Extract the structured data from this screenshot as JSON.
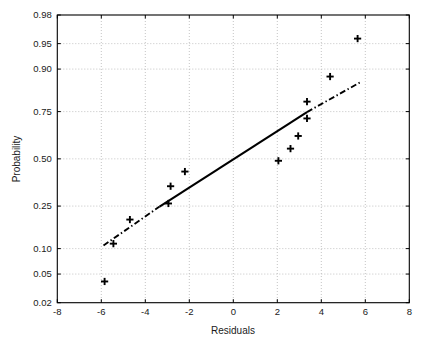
{
  "chart_data": {
    "type": "scatter",
    "title": "",
    "subtitle": "",
    "xlabel": "Residuals",
    "ylabel": "Probability",
    "xlim": [
      -8,
      8
    ],
    "ylim": [
      0.02,
      0.98
    ],
    "grid": true,
    "legend": null,
    "x_ticks": [
      -8,
      -6,
      -4,
      -2,
      0,
      2,
      4,
      6,
      8
    ],
    "x_tick_labels": [
      "-8",
      "-6",
      "-4",
      "-2",
      "0",
      "2",
      "4",
      "6",
      "8"
    ],
    "y_ticks": [
      0.02,
      0.05,
      0.1,
      0.25,
      0.5,
      0.75,
      0.9,
      0.95,
      0.98
    ],
    "y_tick_labels": [
      "0.02",
      "0.05",
      "0.10",
      "0.25",
      "0.50",
      "0.75",
      "0.90",
      "0.95",
      "0.98"
    ],
    "y_scale": "normal-probability",
    "series": [
      {
        "name": "data",
        "marker": "plus",
        "color": "#000000",
        "points": [
          {
            "x": -5.85,
            "p": 0.04
          },
          {
            "x": -5.45,
            "p": 0.113
          },
          {
            "x": -4.7,
            "p": 0.193
          },
          {
            "x": -2.95,
            "p": 0.262
          },
          {
            "x": -2.85,
            "p": 0.348
          },
          {
            "x": -2.2,
            "p": 0.428
          },
          {
            "x": 2.05,
            "p": 0.489
          },
          {
            "x": 2.6,
            "p": 0.558
          },
          {
            "x": 2.95,
            "p": 0.628
          },
          {
            "x": 3.35,
            "p": 0.718
          },
          {
            "x": 3.35,
            "p": 0.793
          },
          {
            "x": 4.4,
            "p": 0.88
          },
          {
            "x": 5.65,
            "p": 0.957
          }
        ]
      }
    ],
    "reference_line": {
      "name": "robust-fit-line",
      "style": "solid",
      "color": "#000000",
      "x_start": -3.35,
      "p_start": 0.248,
      "x_end": 3.35,
      "p_end": 0.748
    },
    "extension_lines": [
      {
        "name": "lower-extension",
        "style": "dash-dot",
        "color": "#000000",
        "x_start": -5.9,
        "p_start": 0.108,
        "x_end": -3.35,
        "p_end": 0.248
      },
      {
        "name": "upper-extension",
        "style": "dash-dot",
        "color": "#000000",
        "x_start": 3.35,
        "p_start": 0.748,
        "x_end": 5.75,
        "p_end": 0.862
      }
    ]
  },
  "axes": {
    "x_axis_label": "Residuals",
    "y_axis_label": "Probability"
  },
  "colors": {
    "background": "#ffffff",
    "foreground": "#000000",
    "grid": "#b9b9b9"
  }
}
